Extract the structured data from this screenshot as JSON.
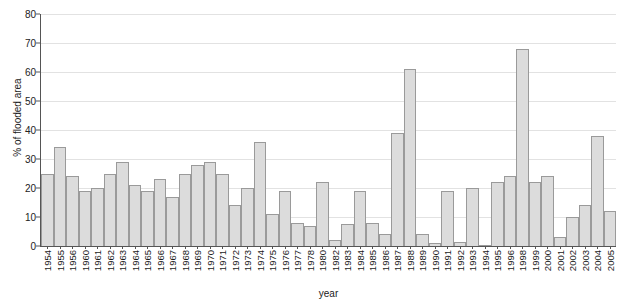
{
  "chart_data": {
    "type": "bar",
    "title": "",
    "xlabel": "year",
    "ylabel": "% of flooded area",
    "ylim": [
      0,
      80
    ],
    "yticks": [
      0,
      10,
      20,
      30,
      40,
      50,
      60,
      70,
      80
    ],
    "grid": true,
    "legend": "none",
    "bar_fill": "#dcdcdc",
    "bar_stroke": "#9a9a9a",
    "categories": [
      "1954",
      "1955",
      "1956",
      "1960",
      "1961",
      "1962",
      "1963",
      "1964",
      "1965",
      "1966",
      "1967",
      "1968",
      "1969",
      "1970",
      "1971",
      "1972",
      "1973",
      "1974",
      "1975",
      "1976",
      "1977",
      "1978",
      "1980",
      "1982",
      "1983",
      "1984",
      "1985",
      "1986",
      "1987",
      "1988",
      "1989",
      "1990",
      "1991",
      "1992",
      "1993",
      "1994",
      "1995",
      "1996",
      "1998",
      "1999",
      "2000",
      "2001",
      "2002",
      "2003",
      "2004",
      "2005"
    ],
    "values": [
      25,
      34,
      24,
      19,
      20,
      25,
      29,
      21,
      19,
      23,
      17,
      25,
      28,
      29,
      25,
      14,
      20,
      36,
      11,
      19,
      8,
      7,
      22,
      2,
      7.5,
      19,
      8,
      4,
      39,
      61,
      4,
      1,
      19,
      1.5,
      20,
      0.3,
      22,
      24,
      68,
      22,
      24,
      3,
      10,
      14,
      38,
      12
    ]
  }
}
